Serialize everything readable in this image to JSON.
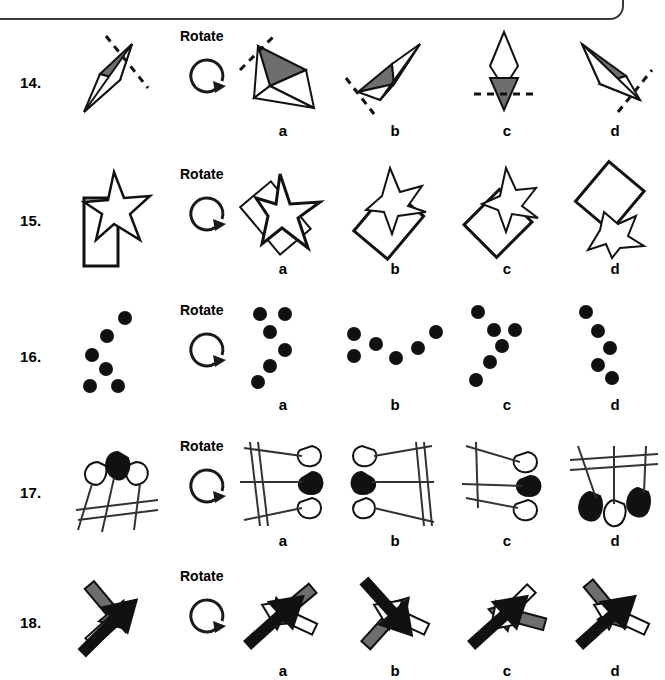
{
  "page": {
    "top_frame_present": true,
    "background_color": "#ffffff",
    "ink_color": "#111111",
    "shade_color": "#6e6e6e"
  },
  "labels": {
    "rotate": "Rotate",
    "rotate_icon_name": "rotate-clockwise-arrow-icon",
    "options": [
      "a",
      "b",
      "c",
      "d"
    ]
  },
  "questions": [
    {
      "number": "14.",
      "figure_kind": "kite-with-shaded-half-and-dashed-axis",
      "options": [
        "a",
        "b",
        "c",
        "d"
      ]
    },
    {
      "number": "15.",
      "figure_kind": "star-overlapping-rectangle",
      "options": [
        "a",
        "b",
        "c",
        "d"
      ]
    },
    {
      "number": "16.",
      "figure_kind": "six-dot-arc-pattern",
      "options": [
        "a",
        "b",
        "c",
        "d"
      ]
    },
    {
      "number": "17.",
      "figure_kind": "three-balloons-with-parallel-lines",
      "options": [
        "a",
        "b",
        "c",
        "d"
      ]
    },
    {
      "number": "18.",
      "figure_kind": "three-crossed-arrows-black-grey-white",
      "options": [
        "a",
        "b",
        "c",
        "d"
      ]
    }
  ]
}
